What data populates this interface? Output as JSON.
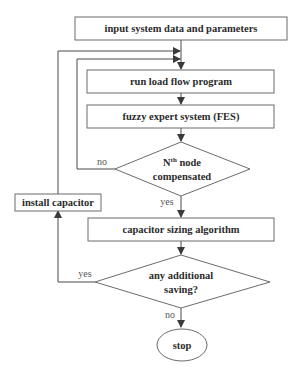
{
  "diagram": {
    "type": "flowchart",
    "nodes": {
      "input": {
        "label": "input system data and parameters",
        "shape": "rectangle"
      },
      "loadflow": {
        "label": "run load flow program",
        "shape": "rectangle"
      },
      "fes": {
        "label": "fuzzy expert system (FES)",
        "shape": "rectangle"
      },
      "decision1": {
        "label_prefix": "N",
        "label_sup": "th",
        "label_line1_rest": " node",
        "label_line2": "compensated",
        "shape": "diamond"
      },
      "sizing": {
        "label": "capacitor sizing algorithm",
        "shape": "rectangle"
      },
      "decision2": {
        "label_line1": "any additional",
        "label_line2": "saving?",
        "shape": "diamond"
      },
      "install": {
        "label": "install capacitor",
        "shape": "rectangle"
      },
      "stop": {
        "label": "stop",
        "shape": "ellipse"
      }
    },
    "edges": {
      "d1_no": "no",
      "d1_yes": "yes",
      "d2_yes": "yes",
      "d2_no": "no"
    }
  },
  "colors": {
    "stroke": "#6b6b6b",
    "text": "#2b2b2b",
    "background": "#ffffff"
  }
}
